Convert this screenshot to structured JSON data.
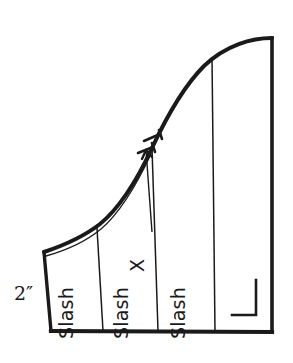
{
  "figure": {
    "background_color": "#ffffff",
    "line_color": "#1a1a1a",
    "measurements": {
      "left_edge_label": "2″"
    },
    "annotations": {
      "x_marker": "X",
      "slash_line_1": "Slash",
      "slash_line_2": "Slash",
      "slash_line_3": "Slash"
    },
    "marks": {
      "right_angle_symbol": "right-angle-corner-mark",
      "tick_mark_1": "seam-tick-mark",
      "tick_mark_2": "seam-tick-mark",
      "leader_arrow": "arrow-pointing-to-curve"
    },
    "geometry": {
      "outline_points": {
        "top_left_corner": [
          44,
          252
        ],
        "bottom_left_corner": [
          51,
          331
        ],
        "bottom_right_corner": [
          272,
          332
        ],
        "top_right_corner": [
          272,
          38
        ]
      },
      "curve_description": "S-curve from upper-left corner rising to top-right corner",
      "slash_line_x_positions_at_base": [
        103,
        158,
        215
      ]
    }
  }
}
